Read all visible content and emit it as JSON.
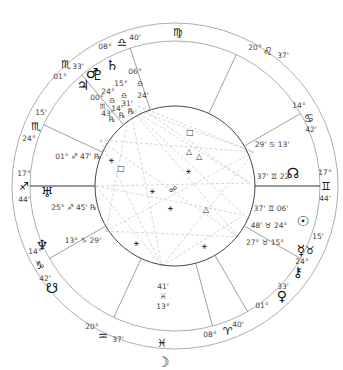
{
  "chart": {
    "center": [
      175,
      186
    ],
    "outer_radius": 163,
    "middle_radius": 145,
    "inner_radius": 80,
    "line_color": "#888888",
    "aspect_line_color": "#cccccc"
  },
  "zodiac_signs": [
    {
      "id": "virgo",
      "glyph": "♍",
      "x": 178,
      "y": 32
    },
    {
      "id": "leo",
      "glyph": "♌",
      "x": 268,
      "y": 51
    },
    {
      "id": "cancer",
      "glyph": "♋",
      "x": 309,
      "y": 118
    },
    {
      "id": "gemini",
      "glyph": "♊",
      "x": 326,
      "y": 186
    },
    {
      "id": "taurus",
      "glyph": "♉",
      "x": 310,
      "y": 250
    },
    {
      "id": "aries",
      "glyph": "♈",
      "x": 228,
      "y": 331
    },
    {
      "id": "pisces",
      "glyph": "♓",
      "x": 162,
      "y": 343
    },
    {
      "id": "aquarius",
      "glyph": "♒",
      "x": 103,
      "y": 336
    },
    {
      "id": "capricorn",
      "glyph": "♑",
      "x": 40,
      "y": 265
    },
    {
      "id": "sagittarius",
      "glyph": "♐",
      "x": 24,
      "y": 186
    },
    {
      "id": "scorpio-lower",
      "glyph": "♏",
      "x": 36,
      "y": 126
    },
    {
      "id": "scorpio-upper",
      "glyph": "♏",
      "x": 66,
      "y": 64
    },
    {
      "id": "libra",
      "glyph": "♎",
      "x": 122,
      "y": 42
    }
  ],
  "house_cusps": [
    {
      "deg": "08°",
      "sign": "♎",
      "min": "40'",
      "deg_pos": [
        105,
        47
      ],
      "min_pos": [
        135,
        38
      ],
      "angle": -108
    },
    {
      "deg": "20°",
      "sign": "♌",
      "min": "37'",
      "deg_pos": [
        255,
        48
      ],
      "min_pos": [
        283,
        56
      ],
      "angle": -65
    },
    {
      "deg": "14°",
      "sign": "♋",
      "min": "42'",
      "deg_pos": [
        299,
        106
      ],
      "min_pos": [
        311,
        130
      ],
      "angle": -30
    },
    {
      "deg": "17°",
      "sign": "♊",
      "min": "44'",
      "deg_pos": [
        325,
        173
      ],
      "min_pos": [
        325,
        199
      ],
      "angle": 0
    },
    {
      "deg": "15'",
      "sign": "♉",
      "min": "24°",
      "deg_pos": [
        318,
        237
      ],
      "min_pos": [
        302,
        262
      ],
      "angle": 30
    },
    {
      "deg": "01°",
      "sign": "♉",
      "min": "33'",
      "deg_pos": [
        262,
        306
      ],
      "min_pos": [
        283,
        287
      ],
      "angle": 60
    },
    {
      "deg": "08°",
      "sign": "♈",
      "min": "40'",
      "deg_pos": [
        210,
        335
      ],
      "min_pos": [
        238,
        325
      ],
      "angle": 75
    },
    {
      "deg": "20°",
      "sign": "♒",
      "min": "37'",
      "deg_pos": [
        92,
        327
      ],
      "min_pos": [
        118,
        340
      ],
      "angle": 115
    },
    {
      "deg": "14°",
      "sign": "♑",
      "min": "42'",
      "deg_pos": [
        35,
        252
      ],
      "min_pos": [
        45,
        279
      ],
      "angle": 150
    },
    {
      "deg": "17°",
      "sign": "♐",
      "min": "44'",
      "deg_pos": [
        24,
        174
      ],
      "min_pos": [
        24,
        200
      ],
      "angle": 180
    },
    {
      "deg": "15'",
      "sign": "♏",
      "min": "24°",
      "deg_pos": [
        41,
        113
      ],
      "min_pos": [
        29,
        139
      ],
      "angle": -155
    },
    {
      "deg": "01°",
      "sign": "♏",
      "min": "33'",
      "deg_pos": [
        60,
        77
      ],
      "min_pos": [
        78,
        67
      ],
      "angle": -130
    }
  ],
  "planets": [
    {
      "name": "Mars",
      "glyph": "♂",
      "x": 92,
      "y": 33,
      "pos": "06° ♎ 24'"
    },
    {
      "name": "Saturn",
      "glyph": "♄",
      "x": 112,
      "y": 25,
      "pos": "15° ♎ 31' ℞"
    },
    {
      "name": "Pluto",
      "glyph": "♇",
      "x": 98,
      "y": 35,
      "pos": "24° ♎ 14' ℞"
    },
    {
      "name": "Jupiter",
      "glyph": "♃",
      "x": 83,
      "y": 45,
      "pos": "00° ♏ 43' ℞"
    },
    {
      "name": "Uranus",
      "glyph": "♅",
      "x": 47,
      "y": 152,
      "pos": "01° ♐ 47' ℞"
    },
    {
      "name": "Neptune",
      "glyph": "♆",
      "x": 42,
      "y": 205,
      "pos": "25° ♐ 45' ℞"
    },
    {
      "name": "South Node",
      "glyph": "☋",
      "x": 52,
      "y": 248,
      "pos": "13° ♑ 29'"
    },
    {
      "name": "Moon",
      "glyph": "☽",
      "x": 163,
      "y": 322,
      "pos": "13° ♓ 41'"
    },
    {
      "name": "Venus",
      "glyph": "♀",
      "x": 282,
      "y": 256,
      "pos": "15° ♉ 27'"
    },
    {
      "name": "Chiron",
      "glyph": "⚷",
      "x": 298,
      "y": 232,
      "pos": "24° ♉ 48'"
    },
    {
      "name": "Mercury",
      "glyph": "☿",
      "x": 301,
      "y": 210,
      "pos": "06° ♊ 37'"
    },
    {
      "name": "Sun",
      "glyph": "☉",
      "x": 303,
      "y": 181,
      "pos": "22° ♊ 37'"
    },
    {
      "name": "North Node",
      "glyph": "☊",
      "x": 293,
      "y": 133,
      "pos": "13° ♋ 29'"
    }
  ],
  "planet_labels": [
    {
      "text": "06°",
      "x": 135,
      "y": 72
    },
    {
      "text": "♎",
      "x": 140,
      "y": 84
    },
    {
      "text": "24'",
      "x": 143,
      "y": 96
    },
    {
      "text": "15°",
      "x": 121,
      "y": 84
    },
    {
      "text": "♎",
      "x": 124,
      "y": 96
    },
    {
      "text": "31'",
      "x": 127,
      "y": 104
    },
    {
      "text": "℞",
      "x": 131,
      "y": 112
    },
    {
      "text": "24°",
      "x": 108,
      "y": 92
    },
    {
      "text": "♎",
      "x": 112,
      "y": 101
    },
    {
      "text": "14'",
      "x": 117,
      "y": 109
    },
    {
      "text": "℞",
      "x": 122,
      "y": 116
    },
    {
      "text": "00°",
      "x": 97,
      "y": 98
    },
    {
      "text": "♏",
      "x": 103,
      "y": 107
    },
    {
      "text": "43'",
      "x": 107,
      "y": 114
    },
    {
      "text": "℞",
      "x": 112,
      "y": 120
    },
    {
      "text": "01° ♐ 47' ℞",
      "x": 78,
      "y": 157
    },
    {
      "text": "25° ♐ 45' ℞",
      "x": 74,
      "y": 208
    },
    {
      "text": "13° ♑ 29'",
      "x": 83,
      "y": 241
    },
    {
      "text": "41'",
      "x": 163,
      "y": 287
    },
    {
      "text": "♓",
      "x": 163,
      "y": 297
    },
    {
      "text": "13°",
      "x": 163,
      "y": 307
    },
    {
      "text": "27°  ♉ 15°",
      "x": 265,
      "y": 243
    },
    {
      "text": "48'  ♉ 24°",
      "x": 269,
      "y": 226
    },
    {
      "text": "37' ♊ 06'",
      "x": 271,
      "y": 209
    },
    {
      "text": "37' ♊ 22'",
      "x": 274,
      "y": 177
    },
    {
      "text": "29' ♋ 13'",
      "x": 272,
      "y": 145
    }
  ],
  "aspect_symbols": [
    {
      "glyph": "□",
      "x": 190,
      "y": 133
    },
    {
      "glyph": "△",
      "x": 189,
      "y": 152
    },
    {
      "glyph": "△",
      "x": 199,
      "y": 157
    },
    {
      "glyph": "⚹",
      "x": 188,
      "y": 172
    },
    {
      "glyph": "⚹",
      "x": 111,
      "y": 161
    },
    {
      "glyph": "□",
      "x": 121,
      "y": 169
    },
    {
      "glyph": "⚹",
      "x": 152,
      "y": 192
    },
    {
      "glyph": "☍",
      "x": 173,
      "y": 190
    },
    {
      "glyph": "⚹",
      "x": 170,
      "y": 209
    },
    {
      "glyph": "△",
      "x": 206,
      "y": 210
    },
    {
      "glyph": "⚹",
      "x": 136,
      "y": 244
    },
    {
      "glyph": "⚹",
      "x": 204,
      "y": 247
    }
  ],
  "aspect_lines": [
    [
      130,
      108,
      254,
      152
    ],
    [
      130,
      108,
      250,
      183
    ],
    [
      130,
      108,
      244,
      215
    ],
    [
      130,
      108,
      238,
      237
    ],
    [
      138,
      106,
      254,
      152
    ],
    [
      138,
      106,
      250,
      183
    ],
    [
      100,
      140,
      254,
      152
    ],
    [
      96,
      186,
      250,
      183
    ],
    [
      96,
      186,
      244,
      215
    ],
    [
      100,
      140,
      162,
      266
    ],
    [
      106,
      231,
      254,
      152
    ],
    [
      106,
      231,
      238,
      237
    ],
    [
      162,
      266,
      254,
      152
    ],
    [
      162,
      266,
      244,
      215
    ],
    [
      96,
      186,
      162,
      266
    ],
    [
      130,
      108,
      162,
      266
    ],
    [
      100,
      140,
      238,
      237
    ],
    [
      106,
      231,
      130,
      108
    ]
  ]
}
